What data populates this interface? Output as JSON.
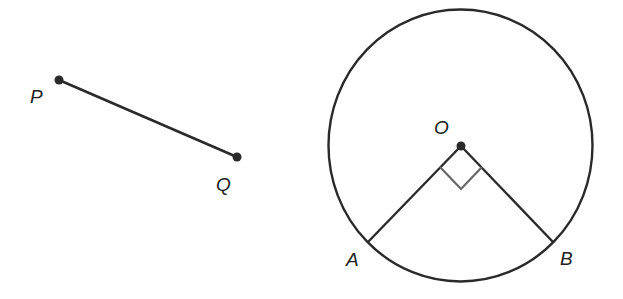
{
  "colors": {
    "stroke": "#2a2a2a",
    "right_angle": "#666666",
    "background": "#ffffff"
  },
  "figure_left": {
    "type": "line-segment",
    "points": [
      {
        "label": "P",
        "x": 59,
        "y": 80,
        "label_x": 30,
        "label_y": 103
      },
      {
        "label": "Q",
        "x": 237,
        "y": 157,
        "label_x": 216,
        "label_y": 191
      }
    ]
  },
  "figure_right": {
    "type": "circle-with-radii",
    "center": {
      "label": "O",
      "x": 461,
      "y": 146,
      "label_x": 434,
      "label_y": 134
    },
    "rx": 132,
    "ry": 136,
    "circle_cx": 460.5,
    "circle_cy": 145.5,
    "points": [
      {
        "label": "A",
        "x": 368,
        "y": 242,
        "label_x": 346,
        "label_y": 266
      },
      {
        "label": "B",
        "x": 553,
        "y": 242,
        "label_x": 560,
        "label_y": 265
      }
    ],
    "right_angle_marker": "M440,167 L461,189 L482,167",
    "angle_AOB": "90°"
  }
}
